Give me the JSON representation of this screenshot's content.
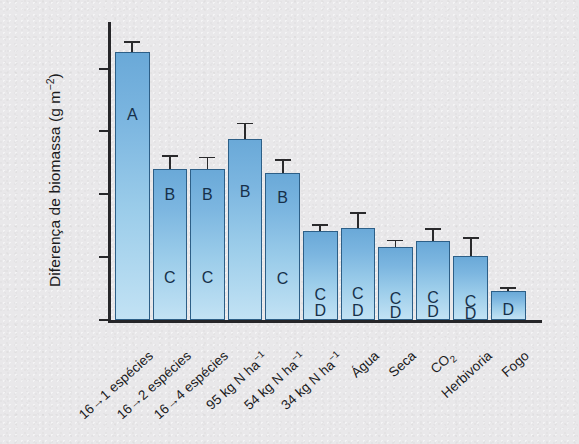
{
  "chart_data": {
    "type": "bar",
    "title": "",
    "xlabel": "",
    "ylabel": "Diferença de biomassa (g m⁻²)",
    "ylim": [
      0,
      225
    ],
    "yticks": [
      0,
      50,
      100,
      150,
      200
    ],
    "ytick_labels": [
      "0",
      "50",
      "100",
      "150",
      "200"
    ],
    "grid": false,
    "legend": "none",
    "categories": [
      "16→1 espécies",
      "16→2 espécies",
      "16→4 espécies",
      "95 kg N ha⁻¹",
      "54 kg N ha⁻¹",
      "34 kg N ha⁻¹",
      "Água",
      "Seca",
      "CO₂",
      "Herbivoria",
      "Fogo"
    ],
    "values": [
      213,
      120,
      120,
      144,
      117,
      71,
      73,
      58,
      63,
      51,
      23
    ],
    "errors": [
      9,
      11,
      10,
      13,
      11,
      5,
      13,
      6,
      10,
      15,
      3
    ],
    "significance_groups": [
      [
        "A"
      ],
      [
        "B",
        "C"
      ],
      [
        "B",
        "C"
      ],
      [
        "B"
      ],
      [
        "B",
        "C"
      ],
      [
        "C",
        "D"
      ],
      [
        "C",
        "D"
      ],
      [
        "C",
        "D"
      ],
      [
        "C",
        "D"
      ],
      [
        "C",
        "D"
      ],
      [
        "D"
      ]
    ]
  },
  "axis": {
    "y_label_main": "Diferença de biomassa (g m",
    "y_label_sup": "−2",
    "y_label_close": ")"
  },
  "colors": {
    "background": "#e9e8ea",
    "bar_fill_top": "#6aa9d8",
    "bar_fill_bottom": "#c2e2f4",
    "bar_stroke": "#2d5f87",
    "axis": "#262629",
    "text": "#1b1b1d",
    "sig_text": "#16304a"
  }
}
